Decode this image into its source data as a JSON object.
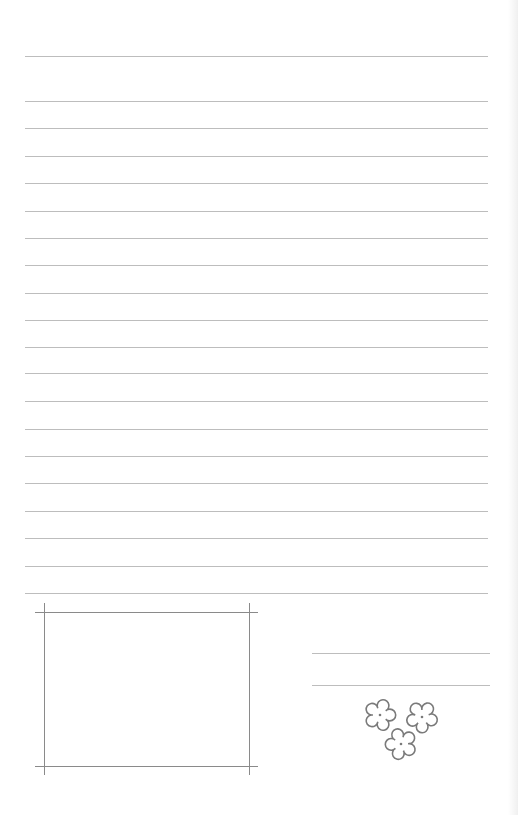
{
  "page": {
    "type": "lined-notepaper",
    "background": "#ffffff",
    "rule_color": "#bdbdbd",
    "frame_color": "#8a8a8a",
    "flower_color": "#7a7a7a"
  },
  "ruled_lines": {
    "x_start": 25,
    "x_end": 488,
    "y_positions": [
      56,
      101,
      128,
      156,
      183,
      211,
      238,
      265,
      293,
      320,
      347,
      373,
      401,
      429,
      456,
      483,
      511,
      538,
      566,
      593
    ]
  },
  "photo_frame": {
    "horizontal": [
      {
        "y": 612,
        "x1": 35,
        "x2": 258
      },
      {
        "y": 766,
        "x1": 35,
        "x2": 258
      }
    ],
    "vertical": [
      {
        "x": 44,
        "y1": 603,
        "y2": 775
      },
      {
        "x": 249,
        "y1": 603,
        "y2": 775
      }
    ]
  },
  "signature_lines": {
    "x_start": 312,
    "x_end": 490,
    "y_positions": [
      653,
      685
    ]
  },
  "decoration": {
    "icon": "flower-cluster",
    "flowers": [
      {
        "cx": 380,
        "cy": 715,
        "r": 13
      },
      {
        "cx": 422,
        "cy": 717,
        "r": 13
      },
      {
        "cx": 401,
        "cy": 744,
        "r": 13
      }
    ]
  }
}
